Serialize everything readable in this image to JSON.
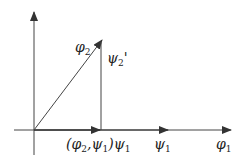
{
  "diagram": {
    "labels": {
      "phi2_symbol": "φ",
      "phi2_sub": "2",
      "psi2p_symbol": "ψ",
      "psi2p_sub": "2",
      "psi2p_prime": "'",
      "proj_open": "(φ",
      "proj_sub1": "2",
      "proj_mid": ",ψ",
      "proj_sub2": "1",
      "proj_close": ")ψ",
      "proj_sub3": "1",
      "psi1_symbol": "ψ",
      "psi1_sub": "1",
      "phi1_symbol": "φ",
      "phi1_sub": "1"
    },
    "colors": {
      "line": "#333333",
      "background": "#ffffff"
    }
  }
}
